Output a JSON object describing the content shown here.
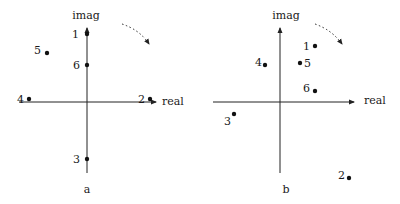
{
  "panels": [
    {
      "id": "a",
      "caption": "a",
      "axis_labels": {
        "x": "real",
        "y": "imag"
      },
      "origin": [
        87,
        101
      ],
      "points": [
        {
          "label": "1",
          "x": 87,
          "y": 34,
          "lx": 79,
          "ly": 38,
          "anchor": "end"
        },
        {
          "label": "5",
          "x": 47,
          "y": 53,
          "lx": 41,
          "ly": 54,
          "anchor": "end"
        },
        {
          "label": "6",
          "x": 87,
          "y": 65,
          "lx": 80,
          "ly": 69,
          "anchor": "end"
        },
        {
          "label": "4",
          "x": 29,
          "y": 99,
          "lx": 24,
          "ly": 103,
          "anchor": "end"
        },
        {
          "label": "2",
          "x": 150,
          "y": 99,
          "lx": 145,
          "ly": 103,
          "anchor": "end"
        },
        {
          "label": "3",
          "x": 87,
          "y": 159,
          "lx": 80,
          "ly": 163,
          "anchor": "end"
        }
      ]
    },
    {
      "id": "b",
      "caption": "b",
      "axis_labels": {
        "x": "real",
        "y": "imag"
      },
      "origin": [
        280,
        101
      ],
      "points": [
        {
          "label": "1",
          "x": 315,
          "y": 46,
          "lx": 310,
          "ly": 50,
          "anchor": "end"
        },
        {
          "label": "4",
          "x": 265,
          "y": 65,
          "lx": 262,
          "ly": 66,
          "anchor": "end"
        },
        {
          "label": "5",
          "x": 300,
          "y": 63,
          "lx": 304,
          "ly": 67,
          "anchor": "start"
        },
        {
          "label": "6",
          "x": 315,
          "y": 91,
          "lx": 310,
          "ly": 92,
          "anchor": "end"
        },
        {
          "label": "3",
          "x": 234,
          "y": 114,
          "lx": 231,
          "ly": 125,
          "anchor": "end"
        },
        {
          "label": "2",
          "x": 349,
          "y": 178,
          "lx": 345,
          "ly": 179,
          "anchor": "end"
        }
      ]
    }
  ]
}
